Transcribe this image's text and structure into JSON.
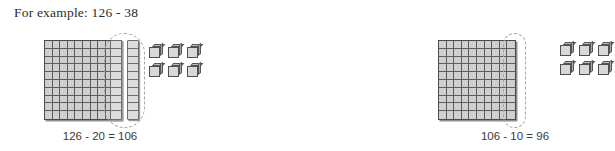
{
  "heading": "For example: 126 - 38",
  "colors": {
    "flat_fill": "#cfcfcf",
    "flat_border": "#4a4a4a",
    "rod_fill": "#dcdcdc",
    "rod_border": "#6e6e6e",
    "cube_face": "#d8d8d8",
    "cube_border": "#4f4f4f",
    "dashed_outline": "#a6a6a6",
    "text": "#2b2b2b",
    "background": "#ffffff"
  },
  "steps": [
    {
      "id": "step-subtract-tens",
      "caption": "126 - 20 = 106",
      "hundreds_flats": 1,
      "flat_rows": 10,
      "flat_columns": 10,
      "ten_rods": 2,
      "rod_segments": 10,
      "unit_cubes": 6,
      "unit_rows": 2,
      "unit_columns": 3,
      "circled": "two-ten-rods",
      "circled_value": 20,
      "minuend": 126,
      "subtrahend": 20,
      "difference": 106
    },
    {
      "id": "step-subtract-ten",
      "caption": "106 - 10 = 96",
      "hundreds_flats": 1,
      "flat_rows": 10,
      "flat_columns": 10,
      "ten_rods": 0,
      "rod_segments": 10,
      "unit_cubes": 6,
      "unit_rows": 2,
      "unit_columns": 3,
      "circled": "last-column-of-flat",
      "circled_value": 10,
      "minuend": 106,
      "subtrahend": 10,
      "difference": 96
    }
  ]
}
